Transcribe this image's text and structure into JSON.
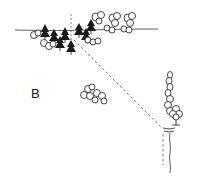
{
  "diagram": {
    "label_b": "B",
    "colors": {
      "ink": "#1a1a1a",
      "background": "#ffffff"
    },
    "elements": [
      {
        "name": "horizon-line",
        "type": "line"
      },
      {
        "name": "conifer-cluster",
        "type": "trees"
      },
      {
        "name": "deciduous-shrubs-top",
        "type": "shrubs"
      },
      {
        "name": "sight-line",
        "type": "dashed-line"
      },
      {
        "name": "shrub-group-center",
        "type": "shrubs"
      },
      {
        "name": "columnar-tree",
        "type": "tree"
      },
      {
        "name": "small-tree",
        "type": "tree"
      },
      {
        "name": "vertical-dashed-line",
        "type": "dashed-line"
      },
      {
        "name": "path-edge-line",
        "type": "wavy-line"
      }
    ]
  }
}
